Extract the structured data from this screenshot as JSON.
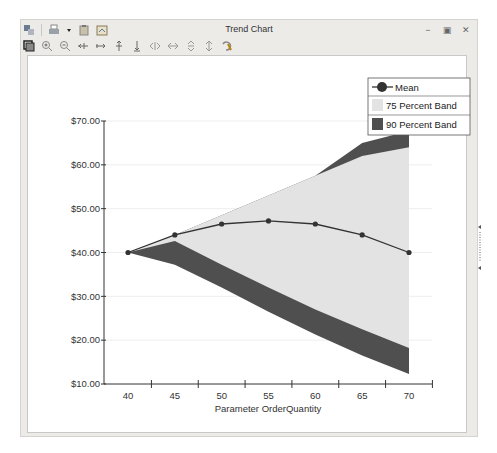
{
  "window": {
    "title": "Trend Chart",
    "controls": [
      {
        "name": "minimize",
        "icon": "minimize-icon",
        "glyph": "−"
      },
      {
        "name": "maximize",
        "icon": "maximize-icon",
        "glyph": "▣"
      },
      {
        "name": "close",
        "icon": "close-icon",
        "glyph": "✕"
      }
    ]
  },
  "toolbar": {
    "row1": [
      {
        "name": "copy-chart",
        "icon": "copy-icon"
      },
      {
        "name": "print",
        "icon": "printer-icon"
      },
      {
        "name": "print-dropdown",
        "icon": "dropdown-arrow-icon"
      },
      {
        "name": "paste",
        "icon": "clipboard-icon"
      },
      {
        "name": "export",
        "icon": "export-image-icon"
      }
    ],
    "row2": [
      {
        "name": "chart-options",
        "icon": "chart-options-icon"
      },
      {
        "name": "zoom-in",
        "icon": "zoom-in-icon"
      },
      {
        "name": "zoom-out",
        "icon": "zoom-out-icon"
      },
      {
        "name": "shrink-horizontal",
        "icon": "shrink-horizontal-icon"
      },
      {
        "name": "expand-horizontal",
        "icon": "expand-horizontal-icon"
      },
      {
        "name": "expand-vertical",
        "icon": "expand-vertical-icon"
      },
      {
        "name": "shrink-vertical",
        "icon": "shrink-vertical-icon"
      },
      {
        "name": "scroll-left",
        "icon": "scroll-left-icon"
      },
      {
        "name": "scroll-right",
        "icon": "scroll-right-icon"
      },
      {
        "name": "scroll-up",
        "icon": "scroll-up-icon"
      },
      {
        "name": "scroll-down",
        "icon": "scroll-down-icon"
      },
      {
        "name": "reset-view",
        "icon": "reset-icon"
      }
    ]
  },
  "colors": {
    "band75": "#e3e3e3",
    "band90": "#4f4f4f",
    "mean_line": "#333333",
    "axis": "#333333",
    "grid": "#eeeeee"
  },
  "chart_data": {
    "type": "area",
    "title": "Trend Chart",
    "xlabel": "Parameter OrderQuantity",
    "ylabel": "",
    "x": [
      40,
      45,
      50,
      55,
      60,
      65,
      70
    ],
    "x_tick_labels": [
      "40",
      "45",
      "50",
      "55",
      "60",
      "65",
      "70"
    ],
    "y_tick_labels": [
      "$10.00",
      "$20.00",
      "$30.00",
      "$40.00",
      "$50.00",
      "$60.00",
      "$70.00"
    ],
    "ylim": [
      10,
      70
    ],
    "grid": true,
    "legend_position": "top-right",
    "legend": [
      "Mean",
      "75 Percent Band",
      "90 Percent Band"
    ],
    "series": [
      {
        "name": "Mean",
        "type": "line",
        "values": [
          40.0,
          44.0,
          46.5,
          47.2,
          46.5,
          44.0,
          40.0
        ]
      },
      {
        "name": "75 Percent Band",
        "type": "band",
        "lower": [
          40.0,
          42.6,
          37.2,
          32.0,
          27.0,
          22.5,
          18.2
        ],
        "upper": [
          40.0,
          44.0,
          48.5,
          53.0,
          57.5,
          62.0,
          64.0
        ]
      },
      {
        "name": "90 Percent Band",
        "type": "band",
        "lower": [
          40.0,
          37.2,
          32.0,
          26.5,
          21.3,
          16.5,
          12.3
        ],
        "upper": [
          40.0,
          44.0,
          48.5,
          53.0,
          57.5,
          65.0,
          67.7
        ]
      }
    ]
  }
}
